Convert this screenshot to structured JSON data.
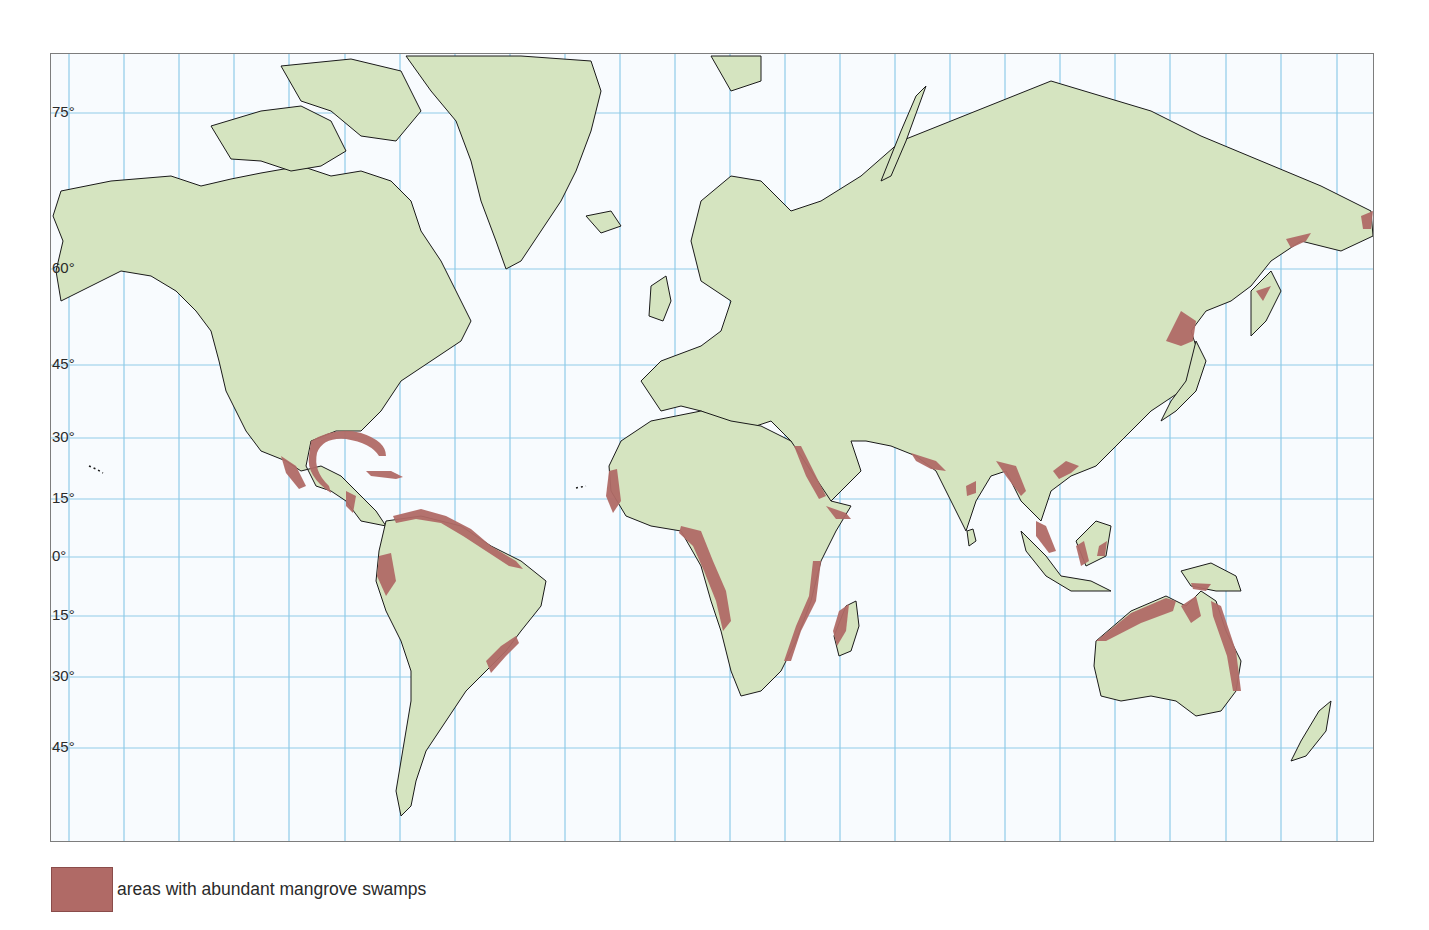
{
  "map": {
    "title": "",
    "projection": "Mercator",
    "colors": {
      "ocean": "#f8fbfe",
      "land": "#d5e4c0",
      "coast": "#1a1a1a",
      "grid": "#8fcbe8",
      "mangrove": "#b06a66",
      "frame": "#7d7d7d"
    },
    "grid": {
      "vertical_x": [
        68,
        123,
        178,
        233,
        288,
        344,
        399,
        454,
        509,
        564,
        619,
        674,
        729,
        784,
        839,
        894,
        949,
        1004,
        1059,
        1114,
        1169,
        1225,
        1280,
        1336
      ],
      "latitude_lines": [
        {
          "label": "75°",
          "y": 112
        },
        {
          "label": "60°",
          "y": 268
        },
        {
          "label": "45°",
          "y": 364
        },
        {
          "label": "30°",
          "y": 437
        },
        {
          "label": "15°",
          "y": 498
        },
        {
          "label": "0°",
          "y": 556
        },
        {
          "label": "15°",
          "y": 615
        },
        {
          "label": "30°",
          "y": 676
        },
        {
          "label": "45°",
          "y": 747
        }
      ]
    },
    "land_masses": [
      {
        "name": "north-america",
        "d": "M60,190 L110,180 L170,175 L200,185 L230,178 L260,172 L300,165 L330,175 L360,170 L390,180 L410,200 L420,230 L440,260 L455,290 L470,320 L460,340 L430,360 L400,380 L380,410 L360,430 L335,430 L310,440 L305,465 L315,485 L330,490 L345,500 L360,520 L385,525 L375,510 L355,490 L340,475 L320,465 L300,470 L285,460 L260,450 L245,430 L225,390 L218,360 L210,330 L195,310 L175,290 L150,275 L120,270 L90,285 L60,300 L55,270 L62,240 L52,215 Z"
      },
      {
        "name": "greenland",
        "d": "M405,55 L520,55 L590,60 L600,90 L590,130 L575,170 L560,200 L540,230 L520,260 L505,268 L495,240 L480,200 L470,160 L455,120 L430,90 Z"
      },
      {
        "name": "canadian-arctic-islands",
        "d": "M210,125 L260,110 L300,105 L330,120 L345,150 L320,165 L290,170 L260,160 L230,158 Z M280,65 L350,58 L400,70 L420,110 L395,140 L360,135 L330,110 L300,100 Z"
      },
      {
        "name": "south-america",
        "d": "M385,520 L420,515 L460,525 L490,545 L520,560 L545,580 L540,605 L520,630 L505,650 L485,670 L465,690 L445,720 L425,750 L415,780 L410,805 L400,815 L395,790 L400,760 L405,730 L410,700 L410,670 L400,640 L385,610 L375,580 L378,550 Z"
      },
      {
        "name": "eurasia",
        "d": "M640,380 L660,360 L700,345 L720,330 L730,300 L700,280 L690,240 L700,200 L730,175 L760,180 L790,210 L820,200 L860,175 L900,140 L950,120 L1000,100 L1050,80 L1100,95 L1150,110 L1200,135 L1260,160 L1320,185 L1370,210 L1372,235 L1340,250 L1300,240 L1270,260 L1250,285 L1230,300 L1205,310 L1190,330 L1200,360 L1180,390 L1150,410 L1120,440 L1095,465 L1070,475 L1050,490 L1040,520 L1020,500 L1005,470 L990,475 L975,500 L965,530 L950,500 L935,470 L915,455 L890,445 L865,440 L850,440 L860,470 L830,500 L800,470 L790,440 L770,420 L740,430 L720,420 L700,410 L680,405 L660,410 Z"
      },
      {
        "name": "africa",
        "d": "M620,440 L650,420 L700,410 L730,420 L760,425 L790,440 L810,470 L830,500 L850,505 L835,530 L820,560 L810,600 L795,640 L780,670 L760,690 L740,695 L730,670 L720,630 L710,600 L700,565 L680,530 L650,525 L625,515 L610,490 L608,465 Z"
      },
      {
        "name": "madagascar",
        "d": "M845,605 L855,600 L858,625 L850,650 L838,655 L833,635 Z"
      },
      {
        "name": "australia",
        "d": "M1095,640 L1130,610 L1165,595 L1185,605 L1200,590 L1215,600 L1225,630 L1240,660 L1235,690 L1220,710 L1195,715 L1175,700 L1150,695 L1120,700 L1100,695 L1093,665 Z"
      },
      {
        "name": "borneo",
        "d": "M1075,540 L1095,520 L1110,525 L1105,555 L1085,565 Z"
      },
      {
        "name": "new-guinea",
        "d": "M1180,570 L1210,562 L1235,575 L1240,590 L1215,590 L1190,585 Z"
      },
      {
        "name": "sumatra-java",
        "d": "M1020,530 L1045,555 L1060,575 L1090,580 L1110,590 L1070,590 L1045,575 L1025,550 Z"
      },
      {
        "name": "new-zealand",
        "d": "M1318,710 L1330,700 L1325,730 L1305,755 L1290,760 L1300,740 Z"
      },
      {
        "name": "japan",
        "d": "M1195,340 L1205,360 L1195,390 L1175,410 L1160,420 L1170,400 L1185,380 Z"
      },
      {
        "name": "kamchatka",
        "d": "M1250,290 L1270,270 L1280,290 L1265,320 L1250,335 Z"
      },
      {
        "name": "uk",
        "d": "M650,285 L665,275 L670,300 L662,320 L648,315 Z"
      },
      {
        "name": "svalbard-novaya-zemlya",
        "d": "M710,55 L760,55 L760,80 L730,90 Z M880,180 L900,130 L915,95 L925,85 L905,140 L890,175 Z"
      },
      {
        "name": "sri-lanka",
        "d": "M966,530 L972,528 L975,540 L968,545 Z"
      },
      {
        "name": "iceland",
        "d": "M585,215 L610,210 L620,225 L600,232 Z"
      }
    ],
    "mangrove_areas": [
      {
        "name": "gulf-of-mexico",
        "d": "M310,440 Q335,425 360,432 Q385,440 385,455 L378,455 Q370,442 345,438 Q322,436 316,452 Q312,470 328,485 L330,492 Q305,475 308,455 Z"
      },
      {
        "name": "pacific-mexico",
        "d": "M280,455 L295,465 L305,485 L298,488 L285,472 Z"
      },
      {
        "name": "cuba",
        "d": "M365,470 L390,470 L402,476 L395,478 L370,475 Z"
      },
      {
        "name": "central-america",
        "d": "M345,490 L355,495 L352,512 L345,505 Z"
      },
      {
        "name": "north-south-america",
        "d": "M392,515 L420,508 L445,515 L470,528 L490,545 L515,560 L522,568 L508,565 L485,550 L462,535 L440,522 L415,518 L395,522 Z"
      },
      {
        "name": "ecuador-colombia-pacific",
        "d": "M378,555 L390,552 L395,580 L385,595 L376,575 Z"
      },
      {
        "name": "brazil-east",
        "d": "M485,660 L500,645 L515,635 L518,642 L505,655 L490,672 Z"
      },
      {
        "name": "west-africa-senegal",
        "d": "M608,470 L616,468 L620,500 L612,512 L605,495 Z"
      },
      {
        "name": "gulf-of-guinea-angola",
        "d": "M680,525 L700,530 L712,560 L725,590 L730,620 L722,630 L715,600 L703,570 L692,545 L678,532 Z"
      },
      {
        "name": "red-sea",
        "d": "M793,445 L800,445 L815,475 L825,495 L818,498 L805,475 Z"
      },
      {
        "name": "gulf-of-aden",
        "d": "M825,505 L845,512 L850,518 L835,518 Z"
      },
      {
        "name": "east-africa",
        "d": "M812,560 L820,560 L815,600 L800,630 L790,660 L783,660 L795,625 L808,595 Z"
      },
      {
        "name": "madagascar-west",
        "d": "M838,610 L848,603 L845,630 L836,645 L832,630 Z"
      },
      {
        "name": "india-west",
        "d": "M910,452 L935,460 L945,470 L930,468 L915,460 Z"
      },
      {
        "name": "india-east",
        "d": "M965,485 L975,480 L975,492 L966,495 Z"
      },
      {
        "name": "bangladesh-myanmar",
        "d": "M995,460 L1015,465 L1025,490 L1020,495 L1005,475 Z"
      },
      {
        "name": "south-china",
        "d": "M1052,470 L1065,460 L1078,465 L1070,472 L1058,478 Z"
      },
      {
        "name": "malay-peninsula",
        "d": "M1035,520 L1045,525 L1055,550 L1048,552 L1035,535 Z"
      },
      {
        "name": "borneo-coast",
        "d": "M1075,545 L1083,540 L1088,560 L1080,565 Z M1098,545 L1106,540 L1104,555 L1096,555 Z"
      },
      {
        "name": "new-guinea-south",
        "d": "M1190,582 L1210,583 L1205,590 L1192,588 Z"
      },
      {
        "name": "north-australia",
        "d": "M1095,640 L1130,612 L1165,597 L1175,600 L1172,610 L1140,622 L1105,640 Z M1180,605 L1195,595 L1200,615 L1190,622 Z"
      },
      {
        "name": "east-australia",
        "d": "M1210,600 L1220,605 L1235,650 L1240,690 L1232,690 L1226,655 L1212,615 Z"
      },
      {
        "name": "east-china-korea",
        "d": "M1180,310 L1195,320 L1192,340 L1180,345 L1165,340 Z"
      },
      {
        "name": "sakhalin-kamchatka",
        "d": "M1285,238 L1310,232 L1305,240 L1290,247 Z M1255,290 L1270,285 L1262,300 Z M1360,215 L1372,210 L1370,228 L1362,228 Z"
      }
    ],
    "small_islands": [
      {
        "name": "hawaii",
        "d": "M88,465 L95,468 L102,472"
      },
      {
        "name": "canary",
        "d": "M575,487 L580,486 L585,485"
      }
    ]
  },
  "legend": {
    "items": [
      {
        "label": "areas with abundant mangrove swamps",
        "color": "#b06a66"
      }
    ]
  }
}
